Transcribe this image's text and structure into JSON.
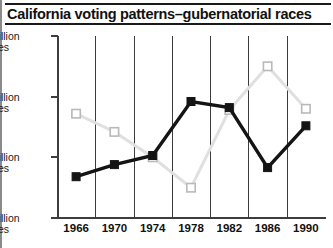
{
  "header": {
    "title": "California voting patterns–gubernatorial races"
  },
  "chart_data": {
    "type": "line",
    "title": "California voting patterns–gubernatorial races",
    "xlabel": "",
    "ylabel": "",
    "categories": [
      "1966",
      "1970",
      "1974",
      "1978",
      "1982",
      "1986",
      "1990"
    ],
    "x_tick_labels": [
      "1966",
      "1970",
      "1974",
      "1978",
      "1982",
      "1986",
      "1990"
    ],
    "y_tick_labels": [
      "5million votes",
      "4million votes",
      "3million votes",
      "2million votes"
    ],
    "y_tick_values": [
      5,
      4,
      3,
      2
    ],
    "ylim": [
      2,
      5
    ],
    "y_units": "million votes",
    "grid": "vertical",
    "legend": "none",
    "series": [
      {
        "name": "dark-series",
        "color": "#141414",
        "marker": "filled-square",
        "values": [
          2.68,
          2.88,
          3.03,
          3.92,
          3.82,
          2.83,
          3.52
        ]
      },
      {
        "name": "light-series",
        "color": "#e0e0e0",
        "marker": "open-square",
        "values": [
          3.72,
          3.42,
          3.0,
          2.5,
          3.78,
          4.5,
          3.8
        ]
      }
    ]
  }
}
